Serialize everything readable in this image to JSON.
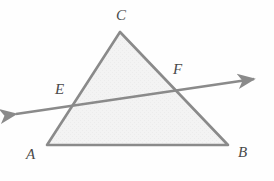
{
  "figure": {
    "kind": "geometry-diagram",
    "background_color": "#fefefe",
    "stroke_color": "#8a8a8a",
    "fill_color": "#f2f2f2",
    "label_color": "#4a4a4a",
    "stroke_width": 2.6
  },
  "shapes": {
    "triangle": {
      "name": "triangle-ABC",
      "vertices": [
        {
          "id": "A",
          "x": 47,
          "y": 145
        },
        {
          "id": "B",
          "x": 228,
          "y": 145
        },
        {
          "id": "C",
          "x": 120,
          "y": 32
        }
      ],
      "points_string": "47,145 228,145 120,32"
    },
    "transversal": {
      "name": "transversal-line-EF",
      "start": {
        "x": 16,
        "y": 114
      },
      "end": {
        "x": 254,
        "y": 79
      },
      "arrowheads": "both",
      "intersections": [
        {
          "id": "E",
          "x": 75,
          "y": 105,
          "on_side": "AC"
        },
        {
          "id": "F",
          "x": 173,
          "y": 90,
          "on_side": "CB"
        }
      ]
    }
  },
  "labels": [
    {
      "name": "vertex-label-C",
      "text": "C",
      "x": 116,
      "y": 8
    },
    {
      "name": "vertex-label-E",
      "text": "E",
      "x": 55,
      "y": 82
    },
    {
      "name": "vertex-label-F",
      "text": "F",
      "x": 173,
      "y": 62
    },
    {
      "name": "vertex-label-A",
      "text": "A",
      "x": 26,
      "y": 147
    },
    {
      "name": "vertex-label-B",
      "text": "B",
      "x": 238,
      "y": 145
    }
  ]
}
